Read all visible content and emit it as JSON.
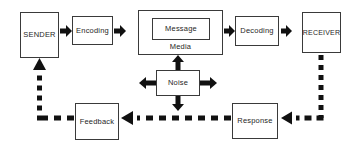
{
  "diagram": {
    "type": "flow-diagram",
    "canvas": {
      "width": 351,
      "height": 149
    },
    "colors": {
      "background": "#ffffff",
      "box_border": "#3a3a3a",
      "box_fill": "#ffffff",
      "text": "#262626",
      "arrow_solid": "#111111",
      "arrow_dashed": "#111111"
    },
    "nodes": {
      "sender": {
        "label": "SENDER",
        "x": 20,
        "y": 12,
        "w": 39,
        "h": 46,
        "font_size": 7.5
      },
      "encoding": {
        "label": "Encoding",
        "x": 72,
        "y": 16,
        "w": 41,
        "h": 29,
        "font_size": 7.5
      },
      "media": {
        "label": "Media",
        "x": 138,
        "y": 10,
        "w": 85,
        "h": 45,
        "font_size": 7.5
      },
      "message": {
        "label": "Message",
        "x": 152,
        "y": 18,
        "w": 58,
        "h": 22,
        "font_size": 7.5
      },
      "decoding": {
        "label": "Decoding",
        "x": 235,
        "y": 16,
        "w": 44,
        "h": 30,
        "font_size": 7.5
      },
      "receiver": {
        "label": "RECEIVER",
        "x": 302,
        "y": 12,
        "w": 39,
        "h": 41,
        "font_size": 7
      },
      "noise": {
        "label": "Noise",
        "x": 156,
        "y": 70,
        "w": 44,
        "h": 26,
        "font_size": 7.5
      },
      "feedback": {
        "label": "Feedback",
        "x": 75,
        "y": 103,
        "w": 44,
        "h": 37,
        "font_size": 7.5
      },
      "response": {
        "label": "Response",
        "x": 232,
        "y": 103,
        "w": 46,
        "h": 36,
        "font_size": 7.5
      }
    },
    "connections": [
      {
        "id": "sender-to-encoding",
        "from": "sender",
        "to": "encoding",
        "style": "solid",
        "direction": "right"
      },
      {
        "id": "encoding-to-media",
        "from": "encoding",
        "to": "media",
        "style": "solid",
        "direction": "right"
      },
      {
        "id": "media-to-decoding",
        "from": "media",
        "to": "decoding",
        "style": "solid",
        "direction": "right"
      },
      {
        "id": "decoding-to-receiver",
        "from": "decoding",
        "to": "receiver",
        "style": "solid",
        "direction": "right"
      },
      {
        "id": "receiver-to-response",
        "from": "receiver",
        "to": "response",
        "style": "dashed",
        "direction": "down-left"
      },
      {
        "id": "response-to-feedback",
        "from": "response",
        "to": "feedback",
        "style": "dashed",
        "direction": "left"
      },
      {
        "id": "feedback-to-sender",
        "from": "feedback",
        "to": "sender",
        "style": "dashed",
        "direction": "left-up"
      },
      {
        "id": "noise-to-media",
        "from": "noise",
        "to": "media",
        "style": "solid",
        "direction": "up"
      },
      {
        "id": "noise-to-feedback-line",
        "from": "noise",
        "to": "feedback-line",
        "style": "solid",
        "direction": "down"
      },
      {
        "id": "noise-left",
        "from": "noise",
        "to": "left",
        "style": "solid",
        "direction": "left"
      },
      {
        "id": "noise-right",
        "from": "noise",
        "to": "right",
        "style": "solid",
        "direction": "right"
      }
    ]
  }
}
